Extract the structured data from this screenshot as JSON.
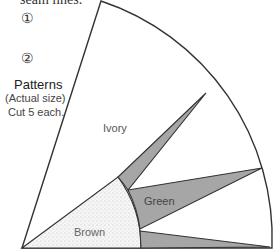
{
  "header": {
    "note_fragment": "seam lines.",
    "markers": [
      "①",
      "②"
    ]
  },
  "caption": {
    "title": "Patterns",
    "subtitle": "(Actual size)",
    "instruction": "Cut 5 each."
  },
  "pattern": {
    "regions": [
      {
        "name": "ivory",
        "label": "Ivory",
        "color": "#ffffff"
      },
      {
        "name": "green",
        "label": "Green",
        "color": "#a6a6a6"
      },
      {
        "name": "brown",
        "label": "Brown",
        "color": "#f2f2f2"
      },
      {
        "name": "gray-strip-upper",
        "label": "",
        "color": "#a6a6a6"
      },
      {
        "name": "gray-strip-lower",
        "label": "",
        "color": "#a6a6a6"
      }
    ],
    "outline_color": "#333333"
  }
}
